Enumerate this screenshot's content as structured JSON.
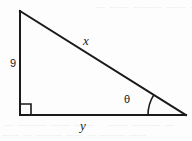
{
  "figure": {
    "name": "right-triangle-diagram",
    "stroke_color": "#1a1a1a",
    "background_color": "#fdfdfd",
    "labels": {
      "vertical_leg": "9",
      "hypotenuse": "x",
      "base": "y",
      "angle": "θ"
    },
    "markers": {
      "right_angle": "right-angle-square",
      "angle_arc": "angle-arc"
    }
  },
  "geometry": {
    "apex": {
      "x": 20,
      "y": 11
    },
    "right_angle_vertex": {
      "x": 20,
      "y": 115
    },
    "angle_vertex": {
      "x": 186,
      "y": 115
    },
    "right_angle_box_size": 11,
    "arc_radius": 38,
    "stroke_width": 2
  },
  "artifacts": {
    "top_bleed": "— —— ——— —— —",
    "bottom_bleed_left": "— ——— ——  ——",
    "bottom_bleed_right": "——  ———  —",
    "mid_bleed": "—— — ——— —— — ——— ——"
  }
}
